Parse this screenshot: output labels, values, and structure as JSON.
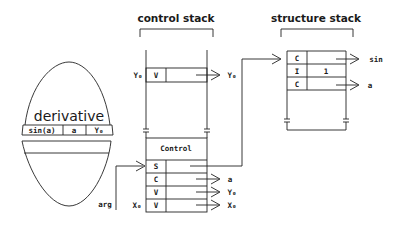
{
  "titles": {
    "control_stack": "control stack",
    "structure_stack": "structure stack"
  },
  "egg": {
    "label": "derivative",
    "cells": [
      "sin(a)",
      "a",
      "Y₀"
    ]
  },
  "control_stack": {
    "top_row": {
      "left_label": "Y₀",
      "tag": "V",
      "target": "Y₀"
    },
    "frame_header": "Control",
    "frame_rows": [
      {
        "left_label": "",
        "tag": "S",
        "target": ""
      },
      {
        "left_label": "",
        "tag": "C",
        "target": "a"
      },
      {
        "left_label": "",
        "tag": "V",
        "target": "Y₀"
      },
      {
        "left_label": "X₀",
        "tag": "V",
        "target": "X₀"
      }
    ],
    "incoming_label": "arg"
  },
  "structure_stack": {
    "rows": [
      {
        "tag": "C",
        "value": "",
        "target": "sin"
      },
      {
        "tag": "I",
        "value": "1",
        "target": ""
      },
      {
        "tag": "C",
        "value": "",
        "target": "a"
      }
    ]
  }
}
